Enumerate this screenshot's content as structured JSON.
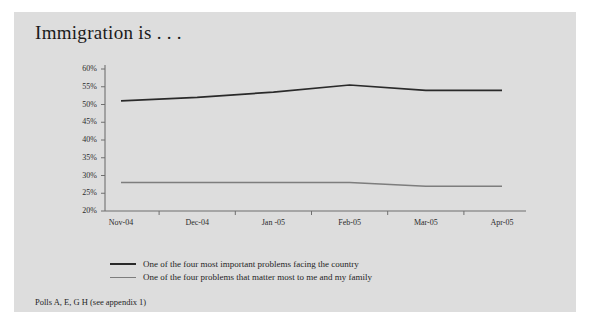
{
  "figure": {
    "title": "Immigration is . . .",
    "footnote": "Polls A, E, G H (see appendix 1)",
    "panel_color": "#dddddd",
    "page_color": "#ffffff"
  },
  "legend": {
    "position": "below-plot",
    "entries": [
      {
        "label": "One of the four most important problems facing the country",
        "color": "#2a2a2a"
      },
      {
        "label": "One of the four problems that matter most to me and my family",
        "color": "#7d7d7d"
      }
    ]
  },
  "chart_data": {
    "type": "line",
    "title": "Immigration is . . .",
    "subtitle": "",
    "xlabel": "",
    "ylabel": "",
    "categories": [
      "Nov-04",
      "Dec-04",
      "Jan -05",
      "Feb-05",
      "Mar-05",
      "Apr-05"
    ],
    "ylim": [
      20,
      60
    ],
    "ytick_labels": [
      "20%",
      "25%",
      "30%",
      "35%",
      "40%",
      "45%",
      "50%",
      "55%",
      "60%"
    ],
    "ytick_values": [
      20,
      25,
      30,
      35,
      40,
      45,
      50,
      55,
      60
    ],
    "yunit": "%",
    "grid": false,
    "series": [
      {
        "name": "One of the four most important problems facing the country",
        "color": "#2a2a2a",
        "values": [
          51,
          52,
          53.5,
          55.5,
          54,
          54
        ]
      },
      {
        "name": "One of the four problems that matter most to me and my family",
        "color": "#7d7d7d",
        "values": [
          28,
          28,
          28,
          28,
          27,
          27
        ]
      }
    ],
    "axis_color": "#6f6f6f"
  }
}
